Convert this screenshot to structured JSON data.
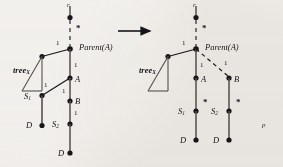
{
  "figure": {
    "background_color": "#f3f1ee",
    "ink_color": "#17161a",
    "transition_arrow": "arrow-right",
    "left_diagram": {
      "title_node": "r",
      "parent_label": "Parent(A)",
      "subtree_label": "tree",
      "subtree_sub": "X",
      "nodes": [
        {
          "id": "r",
          "label": "r"
        },
        {
          "id": "parentA",
          "label": "Parent(A)"
        },
        {
          "id": "A",
          "label": "A"
        },
        {
          "id": "B",
          "label": "B"
        },
        {
          "id": "S1",
          "label": "S"
        },
        {
          "id": "S1sub",
          "label": "1"
        },
        {
          "id": "S2",
          "label": "S"
        },
        {
          "id": "S2sub",
          "label": "2"
        },
        {
          "id": "D1",
          "label": "D"
        },
        {
          "id": "D2",
          "label": "D"
        }
      ],
      "edge_weights": [
        "1",
        "1",
        "1",
        "1",
        "1"
      ],
      "markers": [
        "*"
      ]
    },
    "right_diagram": {
      "title_node": "r",
      "parent_label": "Parent(A)",
      "subtree_label": "tree",
      "subtree_sub": "X",
      "nodes": [
        {
          "id": "r",
          "label": "r"
        },
        {
          "id": "parentA",
          "label": "Parent(A)"
        },
        {
          "id": "A",
          "label": "A"
        },
        {
          "id": "B",
          "label": "B"
        },
        {
          "id": "S1",
          "label": "S"
        },
        {
          "id": "S1sub",
          "label": "1"
        },
        {
          "id": "S2",
          "label": "S"
        },
        {
          "id": "S2sub",
          "label": "2"
        },
        {
          "id": "D1",
          "label": "D"
        },
        {
          "id": "D2",
          "label": "D"
        }
      ],
      "edge_weights": [
        "1",
        "1",
        "1"
      ],
      "markers": [
        "*",
        "*",
        "*"
      ]
    },
    "corner_mark": "p"
  }
}
